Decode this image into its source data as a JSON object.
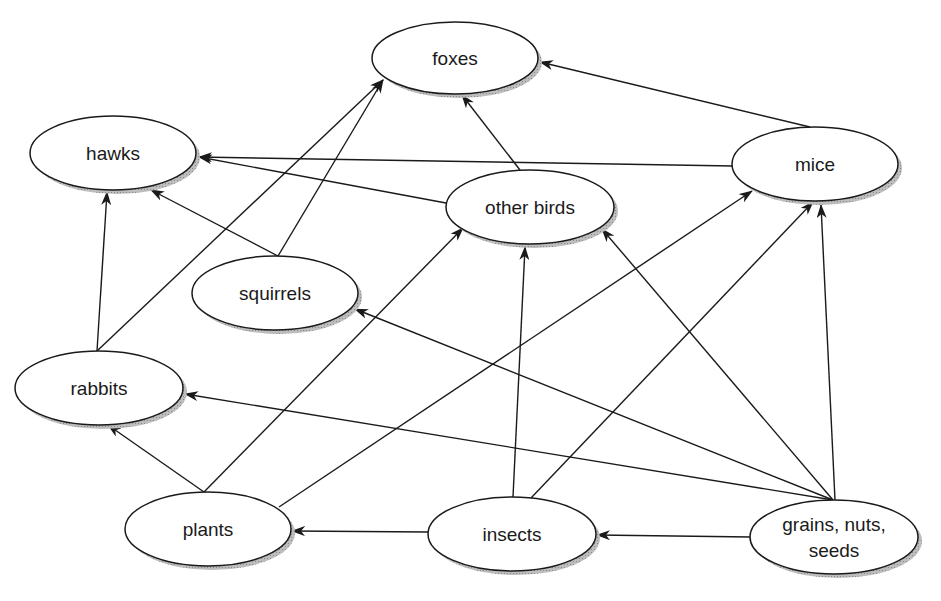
{
  "diagram": {
    "type": "food-web",
    "colors": {
      "line": "#1a1a1a",
      "node_fill": "#ffffff",
      "shadow": "#a8a8a8",
      "background": "#ffffff"
    },
    "nodes": [
      {
        "id": "foxes",
        "label": "foxes",
        "cx": 455,
        "cy": 58,
        "rx": 83,
        "ry": 36
      },
      {
        "id": "hawks",
        "label": "hawks",
        "cx": 113,
        "cy": 153,
        "rx": 83,
        "ry": 37
      },
      {
        "id": "mice",
        "label": "mice",
        "cx": 815,
        "cy": 164,
        "rx": 83,
        "ry": 37
      },
      {
        "id": "other_birds",
        "label": "other birds",
        "cx": 530,
        "cy": 207,
        "rx": 84,
        "ry": 37
      },
      {
        "id": "squirrels",
        "label": "squirrels",
        "cx": 275,
        "cy": 293,
        "rx": 83,
        "ry": 37
      },
      {
        "id": "rabbits",
        "label": "rabbits",
        "cx": 99,
        "cy": 388,
        "rx": 84,
        "ry": 37
      },
      {
        "id": "plants",
        "label": "plants",
        "cx": 208,
        "cy": 529,
        "rx": 83,
        "ry": 37
      },
      {
        "id": "insects",
        "label": "insects",
        "cx": 512,
        "cy": 534,
        "rx": 84,
        "ry": 37
      },
      {
        "id": "grains",
        "label_lines": [
          "grains, nuts,",
          "seeds"
        ],
        "cx": 834,
        "cy": 537,
        "rx": 84,
        "ry": 37
      }
    ],
    "edges": [
      {
        "from": "mice",
        "to": "foxes",
        "x1": 810,
        "y1": 127,
        "x2": 540,
        "y2": 62
      },
      {
        "from": "other_birds",
        "to": "foxes",
        "x1": 520,
        "y1": 170,
        "x2": 462,
        "y2": 95
      },
      {
        "from": "squirrels",
        "to": "foxes",
        "x1": 278,
        "y1": 256,
        "x2": 383,
        "y2": 80
      },
      {
        "from": "rabbits",
        "to": "foxes",
        "x1": 97,
        "y1": 351,
        "x2": 383,
        "y2": 80
      },
      {
        "from": "mice",
        "to": "hawks",
        "x1": 733,
        "y1": 166,
        "x2": 199,
        "y2": 157
      },
      {
        "from": "other_birds",
        "to": "hawks",
        "x1": 446,
        "y1": 203,
        "x2": 199,
        "y2": 157
      },
      {
        "from": "squirrels",
        "to": "hawks",
        "x1": 278,
        "y1": 256,
        "x2": 151,
        "y2": 190
      },
      {
        "from": "rabbits",
        "to": "hawks",
        "x1": 97,
        "y1": 351,
        "x2": 107,
        "y2": 192
      },
      {
        "from": "plants",
        "to": "rabbits",
        "x1": 204,
        "y1": 492,
        "x2": 108,
        "y2": 425
      },
      {
        "from": "plants",
        "to": "other_birds",
        "x1": 204,
        "y1": 492,
        "x2": 463,
        "y2": 228
      },
      {
        "from": "plants",
        "to": "mice",
        "x1": 279,
        "y1": 507,
        "x2": 752,
        "y2": 191
      },
      {
        "from": "insects",
        "to": "other_birds",
        "x1": 513,
        "y1": 497,
        "x2": 525,
        "y2": 247
      },
      {
        "from": "insects",
        "to": "mice",
        "x1": 531,
        "y1": 498,
        "x2": 813,
        "y2": 202
      },
      {
        "from": "insects",
        "to": "plants",
        "x1": 428,
        "y1": 532,
        "x2": 292,
        "y2": 531
      },
      {
        "from": "grains",
        "to": "squirrels",
        "x1": 833,
        "y1": 500,
        "x2": 355,
        "y2": 309
      },
      {
        "from": "grains",
        "to": "rabbits",
        "x1": 833,
        "y1": 500,
        "x2": 185,
        "y2": 394
      },
      {
        "from": "grains",
        "to": "other_birds",
        "x1": 833,
        "y1": 500,
        "x2": 602,
        "y2": 229
      },
      {
        "from": "grains",
        "to": "mice",
        "x1": 835,
        "y1": 500,
        "x2": 821,
        "y2": 205
      },
      {
        "from": "grains",
        "to": "insects",
        "x1": 751,
        "y1": 537,
        "x2": 597,
        "y2": 535
      }
    ]
  }
}
